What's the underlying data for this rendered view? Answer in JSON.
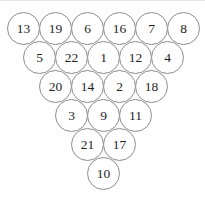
{
  "figure": {
    "type": "number-pyramid",
    "shape": "triangle",
    "background_color": "#ffffff",
    "circle_border_color": "#8d8d8d",
    "number_color": "#1f1f1f",
    "row_count": 6,
    "node_count": 21,
    "rows": [
      {
        "index": 0,
        "left": 7,
        "top": 12,
        "values": [
          13,
          19,
          6,
          16,
          7,
          8
        ]
      },
      {
        "index": 1,
        "left": 23,
        "top": 41,
        "values": [
          5,
          22,
          1,
          12,
          4
        ]
      },
      {
        "index": 2,
        "left": 39,
        "top": 70,
        "values": [
          20,
          14,
          2,
          18
        ]
      },
      {
        "index": 3,
        "left": 55,
        "top": 99,
        "values": [
          3,
          9,
          11
        ]
      },
      {
        "index": 4,
        "left": 71,
        "top": 128,
        "values": [
          21,
          17
        ]
      },
      {
        "index": 5,
        "left": 87,
        "top": 157,
        "values": [
          10
        ]
      }
    ]
  }
}
